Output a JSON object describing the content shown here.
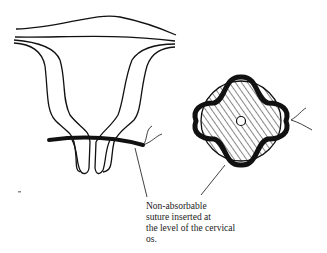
{
  "figure": {
    "caption_lines": [
      "Non-absorbable",
      "suture inserted at",
      "the level of the cervical",
      "os."
    ],
    "left_view": "uterus-cervix-front-view",
    "right_view": "cervix-cross-section-with-suture",
    "colors": {
      "ink": "#111111",
      "background": "#ffffff"
    }
  }
}
